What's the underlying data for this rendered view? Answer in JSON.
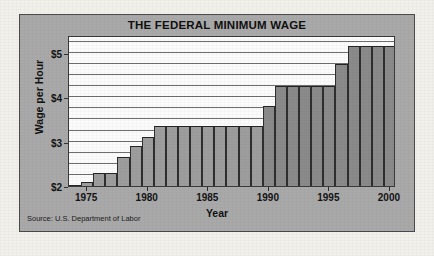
{
  "figure": {
    "title": "THE FEDERAL MINIMUM WAGE",
    "source": "Source: U.S. Department of Labor",
    "panel_color": "#a9a9a9",
    "plot_color": "#fbfbfb",
    "bar_color": "#9d9d9d",
    "border_color": "#3a3a3a"
  },
  "chart_data": {
    "type": "bar",
    "title": "THE FEDERAL MINIMUM WAGE",
    "xlabel": "Year",
    "ylabel": "Wage per Hour",
    "ylim": [
      2.0,
      5.4
    ],
    "xlim": [
      1973.5,
      2000.5
    ],
    "ytick_values": [
      2,
      3,
      4,
      5
    ],
    "ytick_labels": [
      "$2",
      "$3",
      "$4",
      "$5"
    ],
    "xtick_values": [
      1975,
      1980,
      1985,
      1990,
      1995,
      2000
    ],
    "xtick_labels": [
      "1975",
      "1980",
      "1985",
      "1990",
      "1995",
      "2000"
    ],
    "gridline_interval": 0.25,
    "grid": true,
    "legend": "none",
    "annotation": "Source: U.S. Department of Labor",
    "categories": [
      "1974",
      "1975",
      "1976",
      "1977",
      "1978",
      "1979",
      "1980",
      "1981",
      "1982",
      "1983",
      "1984",
      "1985",
      "1986",
      "1987",
      "1988",
      "1989",
      "1990",
      "1991",
      "1992",
      "1993",
      "1994",
      "1995",
      "1996",
      "1997",
      "1998",
      "1999",
      "2000"
    ],
    "values": [
      2.0,
      2.1,
      2.3,
      2.3,
      2.65,
      2.9,
      3.1,
      3.35,
      3.35,
      3.35,
      3.35,
      3.35,
      3.35,
      3.35,
      3.35,
      3.35,
      3.8,
      4.25,
      4.25,
      4.25,
      4.25,
      4.25,
      4.75,
      5.15,
      5.15,
      5.15,
      5.15
    ]
  }
}
